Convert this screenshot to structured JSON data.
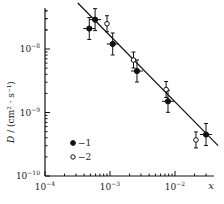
{
  "chart_data": {
    "type": "scatter",
    "title": "",
    "xlabel": "x",
    "ylabel": "D / (cm²·s⁻¹)",
    "xscale": "log",
    "yscale": "log",
    "xlim": [
      0.0001,
      0.04
    ],
    "ylim": [
      1e-10,
      6e-08
    ],
    "x_ticks": [
      {
        "value": 0.0001,
        "base": "10",
        "exp": "−4"
      },
      {
        "value": 0.001,
        "base": "10",
        "exp": "−3"
      },
      {
        "value": 0.01,
        "base": "10",
        "exp": "−2"
      }
    ],
    "y_ticks": [
      {
        "value": 1e-08,
        "base": "10",
        "exp": "−8"
      },
      {
        "value": 1e-09,
        "base": "10",
        "exp": "−9"
      },
      {
        "value": 1e-10,
        "base": "10",
        "exp": "−10"
      }
    ],
    "grid": false,
    "legend_position": "lower-left inside",
    "series": [
      {
        "name": "1",
        "marker": "filled-circle",
        "points": [
          {
            "x": 0.00048,
            "y": 2.1e-08
          },
          {
            "x": 0.00059,
            "y": 2.9e-08
          },
          {
            "x": 0.0011,
            "y": 1.2e-08
          },
          {
            "x": 0.0026,
            "y": 4.5e-09
          },
          {
            "x": 0.0078,
            "y": 1.5e-09
          },
          {
            "x": 0.03,
            "y": 4.5e-10
          }
        ]
      },
      {
        "name": "2",
        "marker": "open-circle",
        "points": [
          {
            "x": 0.0009,
            "y": 2.5e-08
          },
          {
            "x": 0.0023,
            "y": 6.7e-09
          },
          {
            "x": 0.0073,
            "y": 2.3e-09
          },
          {
            "x": 0.021,
            "y": 3.7e-10
          }
        ]
      }
    ],
    "fit_line": {
      "x": [
        0.00032,
        0.046
      ],
      "y": [
        5.3e-08,
        3e-10
      ]
    }
  },
  "legend": {
    "item1": "−1",
    "item2": "−2"
  },
  "axis": {
    "x_label": "x",
    "y_label_D": "D",
    "y_label_unit": " / (cm² · s⁻¹)"
  }
}
